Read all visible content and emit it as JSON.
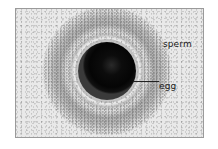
{
  "figure": {
    "type": "labeled micrograph",
    "labels": [
      {
        "id": "sperm",
        "text": "sperm"
      },
      {
        "id": "egg",
        "text": "egg"
      }
    ],
    "colors": {
      "background": "#e9e9e9",
      "egg": "#050505",
      "label_text": "#1a1a1a",
      "frame_border": "#9a9a9a"
    }
  }
}
